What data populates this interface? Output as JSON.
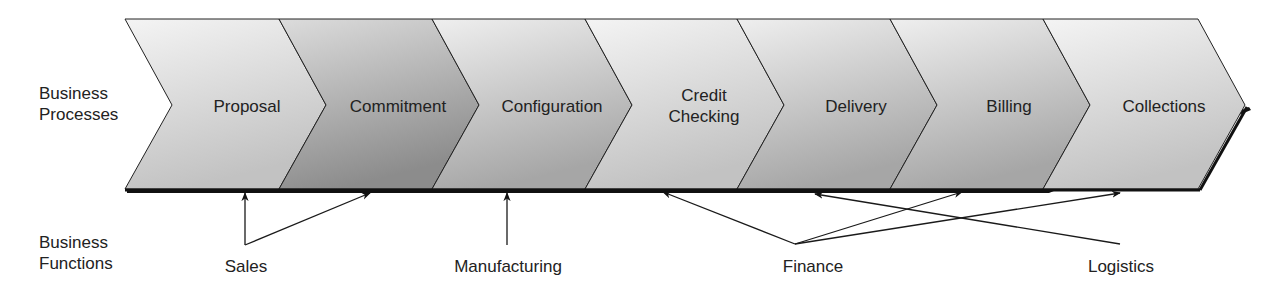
{
  "row_labels": {
    "processes": [
      "Business",
      "Processes"
    ],
    "functions": [
      "Business",
      "Functions"
    ]
  },
  "processes": [
    {
      "lines": [
        "Proposal"
      ],
      "cx": 247,
      "shade": "light"
    },
    {
      "lines": [
        "Commitment"
      ],
      "cx": 398,
      "shade": "dark"
    },
    {
      "lines": [
        "Configuration"
      ],
      "cx": 552,
      "shade": "medium"
    },
    {
      "lines": [
        "Credit",
        "Checking"
      ],
      "cx": 704,
      "shade": "light"
    },
    {
      "lines": [
        "Delivery"
      ],
      "cx": 856,
      "shade": "medium"
    },
    {
      "lines": [
        "Billing"
      ],
      "cx": 1009,
      "shade": "medium"
    },
    {
      "lines": [
        "Collections"
      ],
      "cx": 1164,
      "shade": "light"
    }
  ],
  "functions": [
    {
      "label": "Sales",
      "x": 246,
      "targets": [
        "Proposal",
        "Commitment"
      ]
    },
    {
      "label": "Manufacturing",
      "x": 507,
      "targets": [
        "Configuration"
      ]
    },
    {
      "label": "Finance",
      "x": 812,
      "targets": [
        "Credit Checking",
        "Billing",
        "Collections"
      ]
    },
    {
      "label": "Logistics",
      "x": 1121,
      "targets": [
        "Delivery"
      ]
    }
  ],
  "colors": {
    "light_top": "#f2f2f2",
    "light_bottom": "#c4c4c4",
    "dark_top": "#d6d6d6",
    "dark_bottom": "#8e8e8e",
    "medium_top": "#ececec",
    "medium_bottom": "#a8a8a8",
    "stroke": "#222222"
  }
}
